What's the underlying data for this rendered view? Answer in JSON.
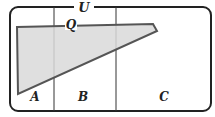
{
  "diagram": {
    "universe_label": "U",
    "set_label": "Q",
    "regions": [
      {
        "label": "A"
      },
      {
        "label": "B"
      },
      {
        "label": "C"
      }
    ],
    "colors": {
      "stroke": "#222222",
      "shape_fill": "#d9d9d9",
      "shape_stroke": "#555555",
      "background": "#ffffff"
    }
  }
}
